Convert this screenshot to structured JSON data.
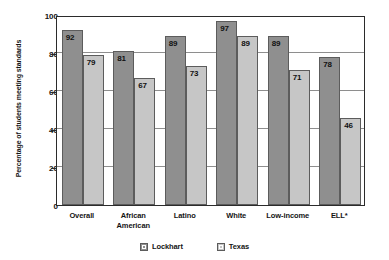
{
  "chart_data": {
    "type": "bar",
    "title": "",
    "subtitle": "",
    "xlabel": "",
    "ylabel": "Percentage of students meeting standards",
    "ylim": [
      0,
      100
    ],
    "yticks": [
      0,
      20,
      40,
      60,
      80,
      100
    ],
    "ytick_labels": [
      "0",
      "20",
      "40",
      "60",
      "80",
      "100"
    ],
    "grid": true,
    "grid_axis": "y",
    "legend_position": "bottom-center",
    "categories": [
      "Overall",
      "African American",
      "Latino",
      "White",
      "Low-income",
      "ELL*"
    ],
    "category_lines": [
      [
        "Overall"
      ],
      [
        "African",
        "American"
      ],
      [
        "Latino"
      ],
      [
        "White"
      ],
      [
        "Low-income"
      ],
      [
        "ELL*"
      ]
    ],
    "series": [
      {
        "name": "Lockhart",
        "color": "#8f8f8f",
        "values": [
          92,
          81,
          89,
          97,
          89,
          78
        ],
        "value_labels": [
          "92",
          "81",
          "89",
          "97",
          "89",
          "78"
        ]
      },
      {
        "name": "Texas",
        "color": "#c6c6c6",
        "values": [
          79,
          67,
          73,
          89,
          71,
          46
        ],
        "value_labels": [
          "79",
          "67",
          "73",
          "89",
          "71",
          "46"
        ]
      }
    ],
    "annotations": []
  },
  "legend": {
    "items": [
      {
        "label": "Lockhart",
        "swatch": "lockhart"
      },
      {
        "label": "Texas",
        "swatch": "texas"
      }
    ]
  },
  "axis": {
    "y_title": "Percentage of students meeting standards"
  }
}
